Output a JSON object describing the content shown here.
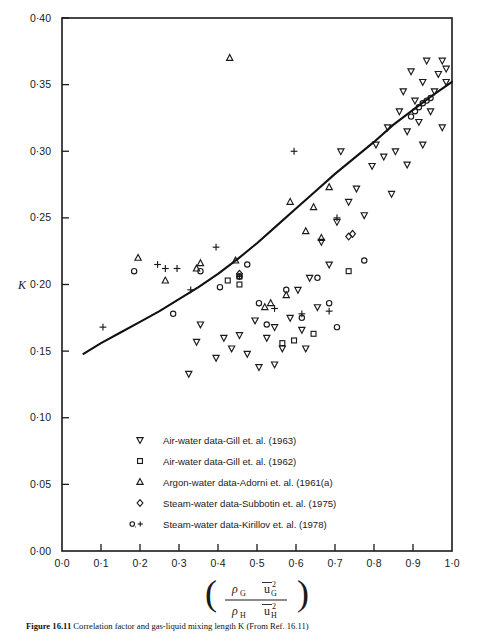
{
  "figure": {
    "caption_label": "Figure 16.11",
    "caption_text": "Correlation factor and gas-liquid mixing length K (From Ref. 16.11)"
  },
  "axes": {
    "y_label": "K",
    "y_ticks": [
      "0·00",
      "0·05",
      "0·10",
      "0·15",
      "0·20",
      "0·25",
      "0·30",
      "0·35",
      "0·40"
    ],
    "y_tick_values": [
      0.0,
      0.05,
      0.1,
      0.15,
      0.2,
      0.25,
      0.3,
      0.35,
      0.4
    ],
    "x_ticks": [
      "0·0",
      "0·1",
      "0·2",
      "0·3",
      "0·4",
      "0·5",
      "0·6",
      "0·7",
      "0·8",
      "0·9",
      "1·0"
    ],
    "x_tick_values": [
      0.0,
      0.1,
      0.2,
      0.3,
      0.4,
      0.5,
      0.6,
      0.7,
      0.8,
      0.9,
      1.0
    ],
    "x_label_numerator_rho": "ρ",
    "x_label_numerator_rho_sub": "G",
    "x_label_numerator_u": "u",
    "x_label_numerator_u_sub": "G",
    "x_label_denominator_rho": "ρ",
    "x_label_denominator_rho_sub": "H",
    "x_label_denominator_u": "u",
    "x_label_denominator_u_sub": "H",
    "x_label_exponent": "2",
    "x_label_plain": "(rho_G u_G^2 / rho_H u_H^2)"
  },
  "legend": {
    "entries": [
      {
        "marker": "triangle-down",
        "label": "Air-water data-Gill et. al. (1963)"
      },
      {
        "marker": "square",
        "label": "Air-water data-Gill et. al. (1962)"
      },
      {
        "marker": "triangle-up",
        "label": "Argon-water data-Adorni et. al. (1961(a)"
      },
      {
        "marker": "diamond",
        "label": "Steam-water data-Subbotin et. al. (1975)"
      },
      {
        "marker": "circle-plus",
        "label": "Steam-water data-Kirillov et. al. (1978)"
      }
    ]
  },
  "chart_data": {
    "type": "scatter",
    "title": "",
    "xlabel": "(rho_G u_G^2)/(rho_H u_H^2)",
    "ylabel": "K",
    "xlim": [
      0.0,
      1.0
    ],
    "ylim": [
      0.0,
      0.4
    ],
    "grid": false,
    "legend_position": "inside-lower-left",
    "series": [
      {
        "name": "Air-water data-Gill et. al. (1963)",
        "marker": "triangle-down",
        "points": [
          [
            0.325,
            0.133
          ],
          [
            0.345,
            0.157
          ],
          [
            0.355,
            0.17
          ],
          [
            0.395,
            0.145
          ],
          [
            0.415,
            0.16
          ],
          [
            0.435,
            0.152
          ],
          [
            0.455,
            0.162
          ],
          [
            0.475,
            0.148
          ],
          [
            0.495,
            0.173
          ],
          [
            0.505,
            0.138
          ],
          [
            0.525,
            0.16
          ],
          [
            0.545,
            0.168
          ],
          [
            0.565,
            0.152
          ],
          [
            0.585,
            0.175
          ],
          [
            0.605,
            0.196
          ],
          [
            0.615,
            0.166
          ],
          [
            0.635,
            0.205
          ],
          [
            0.655,
            0.183
          ],
          [
            0.665,
            0.232
          ],
          [
            0.685,
            0.215
          ],
          [
            0.705,
            0.247
          ],
          [
            0.715,
            0.3
          ],
          [
            0.735,
            0.262
          ],
          [
            0.755,
            0.272
          ],
          [
            0.775,
            0.252
          ],
          [
            0.795,
            0.289
          ],
          [
            0.805,
            0.305
          ],
          [
            0.825,
            0.296
          ],
          [
            0.835,
            0.318
          ],
          [
            0.855,
            0.3
          ],
          [
            0.865,
            0.33
          ],
          [
            0.875,
            0.345
          ],
          [
            0.885,
            0.315
          ],
          [
            0.895,
            0.36
          ],
          [
            0.905,
            0.338
          ],
          [
            0.915,
            0.322
          ],
          [
            0.925,
            0.352
          ],
          [
            0.935,
            0.368
          ],
          [
            0.945,
            0.33
          ],
          [
            0.955,
            0.345
          ],
          [
            0.965,
            0.358
          ],
          [
            0.975,
            0.318
          ],
          [
            0.985,
            0.362
          ],
          [
            0.985,
            0.352
          ],
          [
            0.975,
            0.368
          ],
          [
            0.925,
            0.305
          ],
          [
            0.885,
            0.29
          ],
          [
            0.845,
            0.268
          ],
          [
            0.625,
            0.152
          ],
          [
            0.545,
            0.14
          ]
        ]
      },
      {
        "name": "Air-water data-Gill et. al. (1962)",
        "marker": "square",
        "points": [
          [
            0.455,
            0.206
          ],
          [
            0.565,
            0.156
          ],
          [
            0.595,
            0.158
          ],
          [
            0.645,
            0.163
          ],
          [
            0.735,
            0.21
          ],
          [
            0.425,
            0.203
          ],
          [
            0.455,
            0.2
          ]
        ]
      },
      {
        "name": "Argon-water data-Adorni et. al. (1961(a)",
        "marker": "triangle-up",
        "points": [
          [
            0.195,
            0.22
          ],
          [
            0.265,
            0.203
          ],
          [
            0.345,
            0.212
          ],
          [
            0.355,
            0.216
          ],
          [
            0.43,
            0.37
          ],
          [
            0.535,
            0.186
          ],
          [
            0.585,
            0.262
          ],
          [
            0.625,
            0.24
          ],
          [
            0.645,
            0.258
          ],
          [
            0.665,
            0.235
          ],
          [
            0.685,
            0.273
          ],
          [
            0.575,
            0.192
          ],
          [
            0.52,
            0.183
          ],
          [
            0.445,
            0.218
          ]
        ]
      },
      {
        "name": "Steam-water data-Subbotin et. al. (1975)",
        "marker": "diamond",
        "points": [
          [
            0.455,
            0.208
          ],
          [
            0.735,
            0.236
          ],
          [
            0.745,
            0.238
          ]
        ]
      },
      {
        "name": "Steam-water data-Kirillov et. al. (1978) - circle",
        "marker": "circle",
        "points": [
          [
            0.185,
            0.21
          ],
          [
            0.285,
            0.178
          ],
          [
            0.355,
            0.21
          ],
          [
            0.405,
            0.198
          ],
          [
            0.455,
            0.206
          ],
          [
            0.475,
            0.215
          ],
          [
            0.505,
            0.186
          ],
          [
            0.525,
            0.17
          ],
          [
            0.575,
            0.196
          ],
          [
            0.615,
            0.175
          ],
          [
            0.655,
            0.205
          ],
          [
            0.685,
            0.186
          ],
          [
            0.705,
            0.168
          ],
          [
            0.775,
            0.218
          ],
          [
            0.905,
            0.33
          ],
          [
            0.915,
            0.333
          ],
          [
            0.925,
            0.336
          ],
          [
            0.935,
            0.338
          ],
          [
            0.945,
            0.34
          ],
          [
            0.895,
            0.326
          ]
        ]
      },
      {
        "name": "Steam-water data-Kirillov et. al. (1978) - plus",
        "marker": "plus",
        "points": [
          [
            0.105,
            0.168
          ],
          [
            0.265,
            0.212
          ],
          [
            0.295,
            0.212
          ],
          [
            0.33,
            0.196
          ],
          [
            0.395,
            0.228
          ],
          [
            0.455,
            0.206
          ],
          [
            0.545,
            0.182
          ],
          [
            0.615,
            0.178
          ],
          [
            0.685,
            0.18
          ],
          [
            0.705,
            0.25
          ],
          [
            0.595,
            0.3
          ],
          [
            0.245,
            0.215
          ]
        ]
      }
    ],
    "fit_curve": {
      "name": "correlation curve",
      "points": [
        [
          0.055,
          0.148
        ],
        [
          0.1,
          0.156
        ],
        [
          0.15,
          0.164
        ],
        [
          0.2,
          0.172
        ],
        [
          0.25,
          0.18
        ],
        [
          0.3,
          0.189
        ],
        [
          0.35,
          0.198
        ],
        [
          0.4,
          0.208
        ],
        [
          0.45,
          0.219
        ],
        [
          0.5,
          0.231
        ],
        [
          0.55,
          0.244
        ],
        [
          0.6,
          0.257
        ],
        [
          0.65,
          0.27
        ],
        [
          0.7,
          0.283
        ],
        [
          0.75,
          0.295
        ],
        [
          0.8,
          0.307
        ],
        [
          0.85,
          0.32
        ],
        [
          0.9,
          0.331
        ],
        [
          0.95,
          0.342
        ],
        [
          1.0,
          0.352
        ]
      ]
    }
  }
}
